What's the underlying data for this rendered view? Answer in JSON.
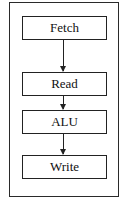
{
  "diagram": {
    "type": "pipeline-flowchart",
    "direction": "top-to-bottom",
    "stages": [
      {
        "label": "Fetch"
      },
      {
        "label": "Read"
      },
      {
        "label": "ALU"
      },
      {
        "label": "Write"
      }
    ],
    "edges": [
      {
        "from": "Fetch",
        "to": "Read"
      },
      {
        "from": "Read",
        "to": "ALU"
      },
      {
        "from": "ALU",
        "to": "Write"
      }
    ],
    "colors": {
      "stroke": "#222222",
      "background": "#ffffff",
      "text": "#111111"
    }
  }
}
